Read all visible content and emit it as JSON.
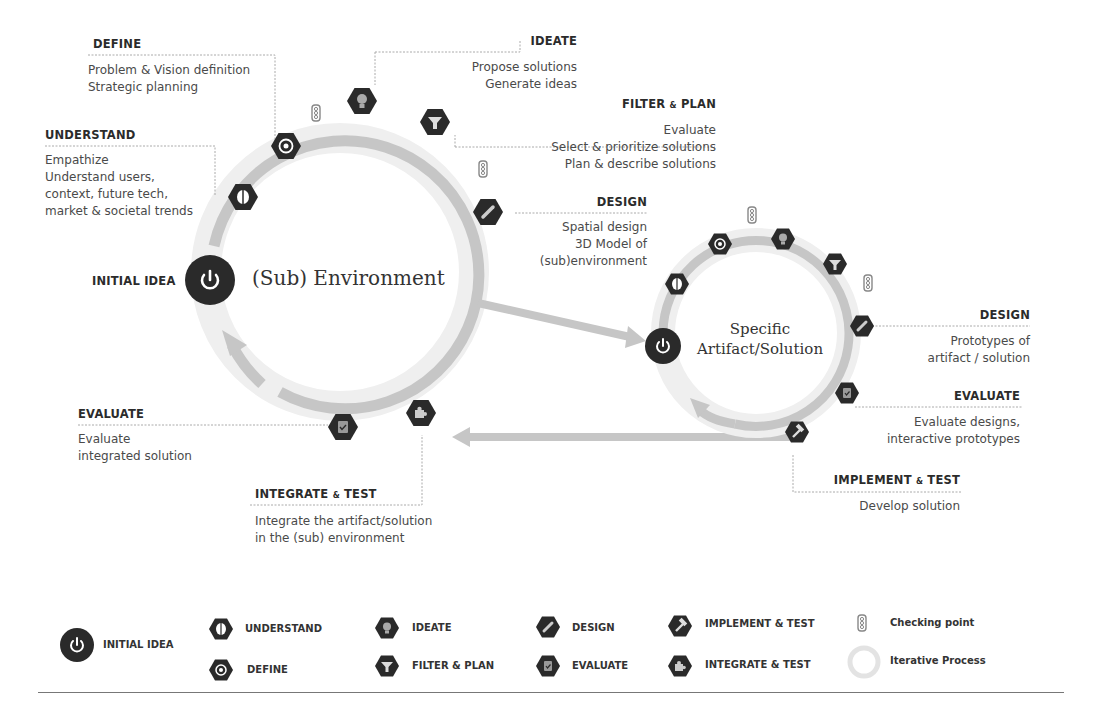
{
  "diagram": {
    "left_cycle": {
      "title": "(Sub) Environment",
      "initial_label": "INITIAL IDEA",
      "steps": [
        {
          "id": "understand",
          "title": "UNDERSTAND",
          "lines": [
            "Empathize",
            "Understand users,",
            "context, future tech,",
            "market & societal trends"
          ]
        },
        {
          "id": "define",
          "title": "DEFINE",
          "lines": [
            "Problem & Vision definition",
            "Strategic planning"
          ]
        },
        {
          "id": "ideate",
          "title": "IDEATE",
          "lines": [
            "Propose solutions",
            "Generate ideas"
          ]
        },
        {
          "id": "filter",
          "title_a": "FILTER",
          "title_amp": "&",
          "title_b": "PLAN",
          "lines": [
            "Evaluate",
            "Select & prioritize solutions",
            "Plan & describe solutions"
          ]
        },
        {
          "id": "design",
          "title": "DESIGN",
          "lines": [
            "Spatial design",
            "3D Model of",
            "(sub)environment"
          ]
        },
        {
          "id": "evaluate",
          "title": "EVALUATE",
          "lines": [
            "Evaluate",
            "integrated solution"
          ]
        },
        {
          "id": "integrate",
          "title_a": "INTEGRATE",
          "title_amp": "&",
          "title_b": "TEST",
          "lines": [
            "Integrate the artifact/solution",
            "in the (sub) environment"
          ]
        }
      ]
    },
    "right_cycle": {
      "title_line1": "Specific",
      "title_line2": "Artifact/Solution",
      "steps": [
        {
          "id": "design",
          "title": "DESIGN",
          "lines": [
            "Prototypes of",
            "artifact / solution"
          ]
        },
        {
          "id": "evaluate",
          "title": "EVALUATE",
          "lines": [
            "Evaluate designs,",
            "interactive prototypes"
          ]
        },
        {
          "id": "implement",
          "title_a": "IMPLEMENT",
          "title_amp": "&",
          "title_b": "TEST",
          "lines": [
            "Develop solution"
          ]
        }
      ]
    }
  },
  "legend": {
    "items": [
      {
        "icon": "power-icon",
        "label": "INITIAL IDEA"
      },
      {
        "icon": "brain-icon",
        "label": "UNDERSTAND"
      },
      {
        "icon": "target-icon",
        "label": "DEFINE"
      },
      {
        "icon": "lightbulb-icon",
        "label": "IDEATE"
      },
      {
        "icon": "filter-icon",
        "label": "FILTER & PLAN"
      },
      {
        "icon": "pencil-icon",
        "label": "DESIGN"
      },
      {
        "icon": "clipboard-check-icon",
        "label": "EVALUATE"
      },
      {
        "icon": "hammer-icon",
        "label": "IMPLEMENT & TEST"
      },
      {
        "icon": "puzzle-icon",
        "label": "INTEGRATE & TEST"
      },
      {
        "icon": "traffic-light-icon",
        "label": "Checking point"
      },
      {
        "icon": "cycle-ring-icon",
        "label": "Iterative Process"
      }
    ]
  },
  "colors": {
    "node": "#2a2a2a",
    "ring": "#c6c6c6",
    "halo": "#ececec",
    "text": "#333333"
  }
}
